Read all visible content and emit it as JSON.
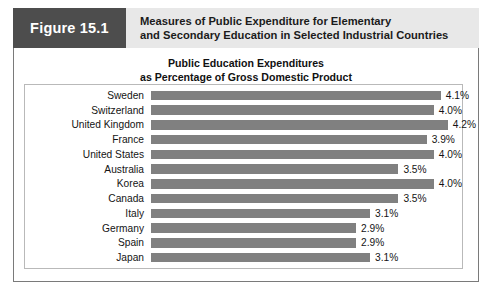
{
  "header": {
    "figure_tag": "Figure 15.1",
    "title_line1": "Measures of Public Expenditure for Elementary",
    "title_line2": "and Secondary Education in Selected Industrial Countries"
  },
  "colors": {
    "tag_background": "#4d4d4d",
    "header_background": "#e8e8e8",
    "bar": "#808080",
    "frame_border": "#7a7a7a",
    "plot_border": "#b9b9b9"
  },
  "chart_data": {
    "type": "bar",
    "orientation": "horizontal",
    "title": "Public Education Expenditures\nas Percentage of Gross Domestic Product",
    "title_line1": "Public Education Expenditures",
    "title_line2": "as Percentage of Gross Domestic Product",
    "xlabel": "",
    "ylabel": "",
    "xlim": [
      0,
      4.4
    ],
    "grid": false,
    "legend": false,
    "categories": [
      "Sweden",
      "Switzerland",
      "United Kingdom",
      "France",
      "United States",
      "Australia",
      "Korea",
      "Canada",
      "Italy",
      "Germany",
      "Spain",
      "Japan"
    ],
    "values": [
      4.1,
      4.0,
      4.2,
      3.9,
      4.0,
      3.5,
      4.0,
      3.5,
      3.1,
      2.9,
      2.9,
      3.1
    ],
    "data_labels": [
      "4.1%",
      "4.0%",
      "4.2%",
      "3.9%",
      "4.0%",
      "3.5%",
      "4.0%",
      "3.5%",
      "3.1%",
      "2.9%",
      "2.9%",
      "3.1%"
    ]
  }
}
